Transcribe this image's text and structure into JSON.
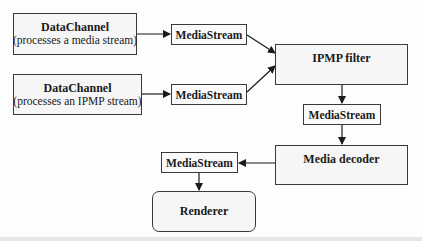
{
  "diagram": {
    "nodes": {
      "datachannel_media": {
        "title": "DataChannel",
        "subtitle": "(processes a media stream)"
      },
      "datachannel_ipmp": {
        "title": "DataChannel",
        "subtitle": "(processes an IPMP stream)"
      },
      "mediastream_1": {
        "label": "MediaStream"
      },
      "mediastream_2": {
        "label": "MediaStream"
      },
      "ipmp_filter": {
        "label": "IPMP filter"
      },
      "mediastream_3": {
        "label": "MediaStream"
      },
      "media_decoder": {
        "label": "Media decoder"
      },
      "mediastream_4": {
        "label": "MediaStream"
      },
      "renderer": {
        "label": "Renderer"
      }
    },
    "edges": [
      {
        "from": "datachannel_media",
        "to": "mediastream_1"
      },
      {
        "from": "datachannel_ipmp",
        "to": "mediastream_2"
      },
      {
        "from": "mediastream_1",
        "to": "ipmp_filter"
      },
      {
        "from": "mediastream_2",
        "to": "ipmp_filter"
      },
      {
        "from": "ipmp_filter",
        "to": "mediastream_3"
      },
      {
        "from": "mediastream_3",
        "to": "media_decoder"
      },
      {
        "from": "media_decoder",
        "to": "mediastream_4"
      },
      {
        "from": "mediastream_4",
        "to": "renderer"
      }
    ]
  }
}
